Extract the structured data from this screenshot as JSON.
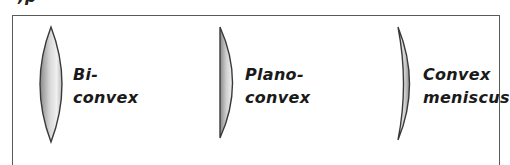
{
  "header": {
    "partial_text": ",p"
  },
  "lenses": [
    {
      "type": "biconvex",
      "label_line1": "Bi-",
      "label_line2": "convex"
    },
    {
      "type": "plano-convex",
      "label_line1": "Plano-",
      "label_line2": "convex"
    },
    {
      "type": "convex-meniscus",
      "label_line1": "Convex",
      "label_line2": "meniscus"
    }
  ],
  "colors": {
    "outline": "#3a3a3a",
    "frame": "#5a5a5a",
    "fill_dark": "#8c8c8c",
    "fill_light": "#f2f2f2",
    "text": "#1a1a1a"
  }
}
